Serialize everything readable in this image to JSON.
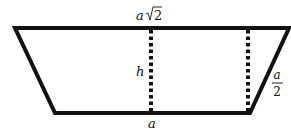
{
  "diagram": {
    "type": "isosceles trapezoid with heights",
    "colors": {
      "stroke": "#111111",
      "background": "#ffffff"
    },
    "labels": {
      "top_side_var": "a",
      "top_side_sqrt": "2",
      "height": "h",
      "slant_side_num": "a",
      "slant_side_den": "2",
      "bottom_side": "a"
    },
    "shape": {
      "vertices": [
        [
          15,
          28
        ],
        [
          289,
          28
        ],
        [
          250,
          113
        ],
        [
          55,
          113
        ]
      ],
      "heights_x": [
        151,
        248
      ]
    }
  }
}
